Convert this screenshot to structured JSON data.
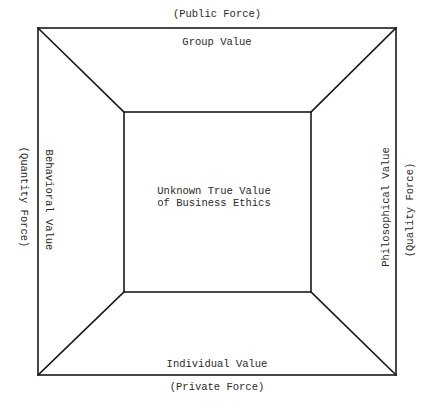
{
  "diagram": {
    "top": {
      "force_label": "(Public Force)",
      "value_label": "Group Value"
    },
    "bottom": {
      "value_label": "Individual Value",
      "force_label": "(Private Force)"
    },
    "left": {
      "value_label": "Behavioral Value",
      "force_label": "(Quantity Force)"
    },
    "right": {
      "value_label": "Philosophical Value",
      "force_label": "(Quality Force)"
    },
    "center": {
      "line1": "Unknown True Value",
      "line2": "of Business Ethics"
    },
    "geometry": {
      "outer_box": [
        38,
        28,
        396,
        375
      ],
      "inner_box": [
        124,
        112,
        311,
        292
      ],
      "stroke_color": "#1a1a1a"
    }
  }
}
